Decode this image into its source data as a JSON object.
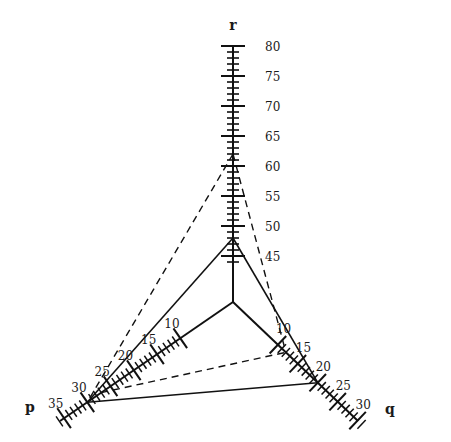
{
  "diagram": {
    "type": "three-axis nomogram",
    "center": [
      233,
      302
    ],
    "axes": {
      "r": {
        "name": "r",
        "name_pos": [
          233,
          30
        ],
        "start": [
          233,
          302
        ],
        "end": [
          233,
          46
        ],
        "min": 44,
        "max": 80,
        "y_at_80": 46,
        "y_at_44": 262,
        "labels": [
          "80",
          "75",
          "70",
          "65",
          "60",
          "55",
          "50",
          "45"
        ],
        "label_values": [
          80,
          75,
          70,
          65,
          60,
          55,
          50,
          45
        ],
        "label_x": 265
      },
      "p": {
        "name": "p",
        "name_pos": [
          30,
          412
        ],
        "start": [
          233,
          302
        ],
        "end": [
          60,
          421
        ],
        "labels": [
          "10",
          "15",
          "20",
          "25",
          "30",
          "35"
        ],
        "label_values": [
          10,
          15,
          20,
          25,
          30,
          35
        ]
      },
      "q": {
        "name": "q",
        "name_pos": [
          390,
          414
        ],
        "start": [
          233,
          302
        ],
        "end": [
          358,
          421
        ],
        "labels": [
          "10",
          "15",
          "20",
          "25",
          "30"
        ],
        "label_values": [
          10,
          15,
          20,
          25,
          30
        ]
      }
    },
    "solid_lines": [
      {
        "from": "r=48",
        "to": "p=30"
      },
      {
        "from": "r=48",
        "to": "q=20"
      },
      {
        "from": "p=30",
        "to": "q=20"
      }
    ],
    "dashed_lines": [
      {
        "from": "r=62",
        "to": "p=30"
      },
      {
        "from": "r=62",
        "to": "q=12"
      },
      {
        "from": "p=27",
        "to": "q=12"
      }
    ]
  }
}
